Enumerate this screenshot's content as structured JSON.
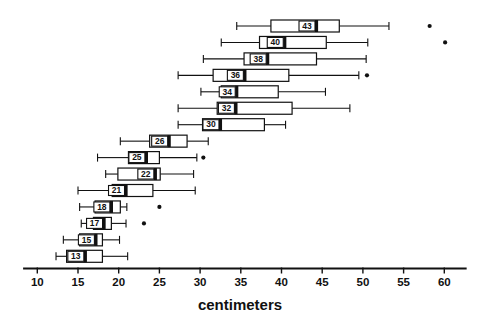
{
  "chart_data": {
    "type": "boxplot",
    "orientation": "horizontal",
    "title": "",
    "xlabel": "centimeters",
    "ylabel": "",
    "xlim": [
      8.5,
      62.5
    ],
    "xticks": [
      10,
      15,
      20,
      25,
      30,
      35,
      40,
      45,
      50,
      55,
      60
    ],
    "xtick_labels": [
      "10",
      "15",
      "20",
      "25",
      "30",
      "35",
      "40",
      "45",
      "50",
      "55",
      "60"
    ],
    "grid": false,
    "legend": null,
    "axis_color": "#111111",
    "box_fill": "#ffffff",
    "box_edge": "#111111",
    "boxes": [
      {
        "label": "43",
        "whisker_low": 34.5,
        "q1": 38.7,
        "median": 44.3,
        "q3": 47.1,
        "whisker_high": 53.2,
        "outliers": [
          58.2
        ]
      },
      {
        "label": "40",
        "whisker_low": 32.6,
        "q1": 37.3,
        "median": 40.4,
        "q3": 45.5,
        "whisker_high": 50.6,
        "outliers": [
          60.1
        ]
      },
      {
        "label": "38",
        "whisker_low": 30.4,
        "q1": 35.4,
        "median": 38.3,
        "q3": 44.3,
        "whisker_high": 50.4,
        "outliers": []
      },
      {
        "label": "36",
        "whisker_low": 27.3,
        "q1": 31.6,
        "median": 35.5,
        "q3": 40.9,
        "whisker_high": 49.5,
        "outliers": [
          50.5
        ]
      },
      {
        "label": "34",
        "whisker_low": 30.1,
        "q1": 32.6,
        "median": 34.5,
        "q3": 39.6,
        "whisker_high": 45.4,
        "outliers": []
      },
      {
        "label": "32",
        "whisker_low": 27.3,
        "q1": 32.1,
        "median": 34.4,
        "q3": 41.3,
        "whisker_high": 48.4,
        "outliers": []
      },
      {
        "label": "30",
        "whisker_low": 27.3,
        "q1": 30.3,
        "median": 32.5,
        "q3": 37.9,
        "whisker_high": 40.5,
        "outliers": []
      },
      {
        "label": "26",
        "whisker_low": 20.2,
        "q1": 23.8,
        "median": 26.2,
        "q3": 28.4,
        "whisker_high": 31.0,
        "outliers": []
      },
      {
        "label": "25",
        "whisker_low": 17.4,
        "q1": 21.2,
        "median": 23.4,
        "q3": 25.0,
        "whisker_high": 29.6,
        "outliers": [
          30.4
        ]
      },
      {
        "label": "22",
        "whisker_low": 18.4,
        "q1": 19.9,
        "median": 24.5,
        "q3": 25.1,
        "whisker_high": 29.2,
        "outliers": []
      },
      {
        "label": "21",
        "whisker_low": 15.0,
        "q1": 19.2,
        "median": 20.9,
        "q3": 24.2,
        "whisker_high": 29.4,
        "outliers": []
      },
      {
        "label": "18",
        "whisker_low": 15.2,
        "q1": 17.1,
        "median": 19.1,
        "q3": 20.2,
        "whisker_high": 21.0,
        "outliers": [
          25.0
        ]
      },
      {
        "label": "17",
        "whisker_low": 15.4,
        "q1": 16.9,
        "median": 18.2,
        "q3": 19.1,
        "whisker_high": 20.9,
        "outliers": [
          23.1
        ]
      },
      {
        "label": "15",
        "whisker_low": 13.2,
        "q1": 15.2,
        "median": 17.2,
        "q3": 18.0,
        "whisker_high": 20.1,
        "outliers": []
      },
      {
        "label": "13",
        "whisker_low": 12.3,
        "q1": 13.6,
        "median": 15.9,
        "q3": 18.0,
        "whisker_high": 21.1,
        "outliers": []
      }
    ]
  }
}
